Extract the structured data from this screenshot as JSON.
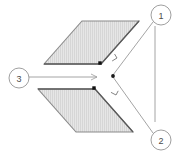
{
  "figure": {
    "background_color": "#ffffff",
    "line_color": "#6e6e6e",
    "leader_color": "#8c8c8c",
    "fill_color": "#e3e3e3",
    "hatch_color": "#cfcfcf",
    "marker_color": "#1a1a1a",
    "callout_text_color": "#4a4a4a",
    "callout_circle_color": "#9a9a9a"
  },
  "callouts": [
    {
      "id": "callout-1",
      "label": "1",
      "cx": 161,
      "cy": 15,
      "r": 10,
      "target_x": 112,
      "target_y": 64,
      "description": "upper plate reference point"
    },
    {
      "id": "callout-2",
      "label": "2",
      "cx": 161,
      "cy": 140,
      "r": 10,
      "target_x": 112,
      "target_y": 87,
      "description": "lower plate reference point"
    },
    {
      "id": "callout-3",
      "label": "3",
      "cx": 19,
      "cy": 78,
      "r": 10,
      "target_x": 98,
      "target_y": 77,
      "description": "gap between plates"
    }
  ],
  "plates": [
    {
      "id": "upper-plate",
      "name": "upper-parallelogram",
      "points": "44,64 82,21 139,21 101,64",
      "marker": {
        "x": 100,
        "y": 63
      }
    },
    {
      "id": "lower-plate",
      "name": "lower-parallelogram",
      "points": "38,89 95,89 133,132 76,132",
      "marker": {
        "x": 94,
        "y": 88
      }
    }
  ],
  "leader_lines": [
    {
      "id": "leader-1",
      "from_x": 153,
      "from_y": 22,
      "to_x": 113,
      "to_y": 75,
      "arrow": "none"
    },
    {
      "id": "leader-2",
      "from_x": 153,
      "from_y": 133,
      "to_x": 113,
      "to_y": 77,
      "arrow": "none"
    },
    {
      "id": "leader-spine",
      "from_x": 155,
      "from_y": 26,
      "to_x": 155,
      "to_y": 122,
      "arrow": "none"
    },
    {
      "id": "leader-3",
      "from_x": 29,
      "from_y": 77,
      "to_x": 97,
      "to_y": 77,
      "arrow": "open-right"
    }
  ],
  "pointers": [
    {
      "id": "pointer-upper",
      "name": "arrowhead-to-upper-marker",
      "from_x": 117,
      "from_y": 58,
      "to_x": 104,
      "to_y": 66
    },
    {
      "id": "pointer-lower",
      "name": "arrowhead-to-lower-marker",
      "from_x": 116,
      "from_y": 95,
      "to_x": 99,
      "to_y": 86
    }
  ],
  "center_marker": {
    "x": 113,
    "y": 76
  }
}
